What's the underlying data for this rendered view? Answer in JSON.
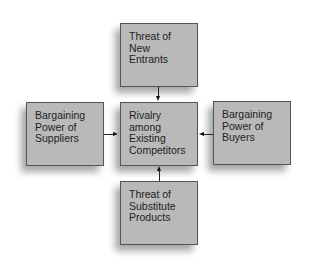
{
  "diagram": {
    "title": "",
    "boxes": {
      "top": {
        "lines": [
          "Threat of",
          "New",
          "Entrants"
        ]
      },
      "left": {
        "lines": [
          "Bargaining",
          "Power of",
          "Suppliers"
        ]
      },
      "center": {
        "lines": [
          "Rivalry",
          "among",
          "Existing",
          "Competitors"
        ]
      },
      "right": {
        "lines": [
          "Bargaining",
          "Power of",
          "Buyers"
        ]
      },
      "bottom": {
        "lines": [
          "Threat of",
          "Substitute",
          "Products"
        ]
      }
    },
    "edges": [
      {
        "from": "top",
        "to": "center"
      },
      {
        "from": "left",
        "to": "center"
      },
      {
        "from": "right",
        "to": "center"
      },
      {
        "from": "bottom",
        "to": "center"
      }
    ],
    "colors": {
      "box_fill": "#b9b9b9",
      "box_border": "#555555",
      "text": "#222222",
      "arrow": "#111111"
    }
  }
}
